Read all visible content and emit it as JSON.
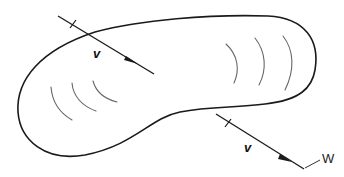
{
  "diagram": {
    "labels": {
      "vector_top": "v",
      "vector_bottom": "v",
      "annotation": "W"
    },
    "colors": {
      "outline": "#1a1a1a",
      "hatch": "#666666",
      "background": "#ffffff"
    }
  }
}
